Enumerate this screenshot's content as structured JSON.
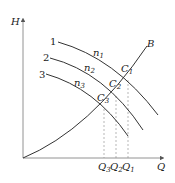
{
  "diagram": {
    "type": "pump-characteristic-curves",
    "axes": {
      "y_label": "H",
      "x_label": "Q"
    },
    "system_curve": {
      "label": "B"
    },
    "pump_curves": [
      {
        "number": "1",
        "speed_label": "n",
        "speed_sub": "1"
      },
      {
        "number": "2",
        "speed_label": "n",
        "speed_sub": "2"
      },
      {
        "number": "3",
        "speed_label": "n",
        "speed_sub": "3"
      }
    ],
    "operating_points": [
      {
        "label": "C",
        "sub": "1"
      },
      {
        "label": "C",
        "sub": "2"
      },
      {
        "label": "C",
        "sub": "3"
      }
    ],
    "flow_ticks": [
      {
        "label": "Q",
        "sub": "3"
      },
      {
        "label": "Q",
        "sub": "2"
      },
      {
        "label": "Q",
        "sub": "1"
      }
    ],
    "colors": {
      "line": "#333333",
      "dashed": "#888888",
      "axis": "#777777"
    }
  }
}
